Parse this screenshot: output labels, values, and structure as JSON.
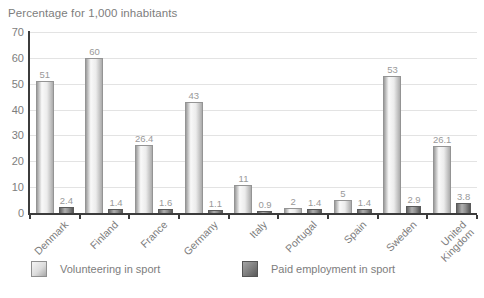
{
  "title": "Percentage for 1,000 inhabitants",
  "chart_data": {
    "type": "bar",
    "title": "Percentage for 1,000 inhabitants",
    "xlabel": "",
    "ylabel": "Percentage for 1,000 inhabitants",
    "categories": [
      "Denmark",
      "Finland",
      "France",
      "Germany",
      "Italy",
      "Portugal",
      "Spain",
      "Sweden",
      "United Kingdom"
    ],
    "category_lines": [
      [
        "Denmark"
      ],
      [
        "Finland"
      ],
      [
        "France"
      ],
      [
        "Germany"
      ],
      [
        "Italy"
      ],
      [
        "Portugal"
      ],
      [
        "Spain"
      ],
      [
        "Sweden"
      ],
      [
        "United",
        "Kingdom"
      ]
    ],
    "series": [
      {
        "name": "Volunteering in sport",
        "values": [
          51,
          60,
          26.4,
          43,
          11,
          2,
          5,
          53,
          26.1
        ]
      },
      {
        "name": "Paid employment in sport",
        "values": [
          2.4,
          1.4,
          1.6,
          1.1,
          0.9,
          1.4,
          1.4,
          2.9,
          3.8
        ]
      }
    ],
    "ylim": [
      0,
      70
    ],
    "yticks": [
      0,
      10,
      20,
      30,
      40,
      50,
      60,
      70
    ],
    "grid": true,
    "legend_position": "bottom"
  },
  "legend": {
    "items": [
      {
        "label": "Volunteering in sport",
        "swatch": "light"
      },
      {
        "label": "Paid employment in sport",
        "swatch": "dark"
      }
    ]
  },
  "colors": {
    "text": "#7d7d7d",
    "value_label": "#999999",
    "axis": "#3c3c3c",
    "gridline": "#e3e3e3",
    "bar_light_edge": "#9c9c9c",
    "bar_light_mid": "#f9f9f9",
    "bar_dark_edge": "#565656",
    "bar_dark_mid": "#b0b0b0"
  }
}
